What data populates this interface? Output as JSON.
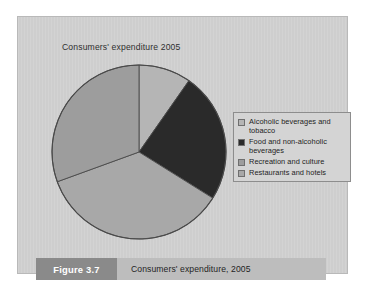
{
  "figure": {
    "number_label": "Figure 3.7",
    "caption": "Consumers' expenditure, 2005"
  },
  "chart_title": "Consumers' expenditure 2005",
  "colors": {
    "panel_background": "#d0d0d0",
    "panel_border": "#b9b9b9",
    "page_background": "#ffffff",
    "pie_outline": "#4a4a4a",
    "legend_background": "#d4d4d4",
    "legend_border": "#8d8d8d",
    "figure_number_bar": "#8a8a8a",
    "caption_bar": "#bdbdbd",
    "figure_number_text": "#ffffff"
  },
  "legend": {
    "position": "right",
    "items": [
      {
        "label": "Alcoholic beverages and tobacco",
        "color": "#b5b5b5",
        "swatch_name": "legend-swatch-alcoholic-beverages-and-tobacco"
      },
      {
        "label": "Food and non-alcoholic beverages",
        "color": "#2a2a2a",
        "swatch_name": "legend-swatch-food-and-non-alcoholic-beverages"
      },
      {
        "label": "Recreation and culture",
        "color": "#9d9d9d",
        "swatch_name": "legend-swatch-recreation-and-culture"
      },
      {
        "label": "Restaurants and hotels",
        "color": "#a8a8a8",
        "swatch_name": "legend-swatch-restaurants-and-hotels"
      }
    ]
  },
  "chart_data": {
    "type": "pie",
    "title": "Consumers' expenditure 2005",
    "xlabel": "",
    "ylabel": "",
    "legend_position": "right",
    "grid": false,
    "start_angle_deg": 0,
    "direction": "clockwise",
    "categories": [
      "Alcoholic beverages and tobacco",
      "Food and non-alcoholic beverages",
      "Recreation and culture",
      "Restaurants and hotels"
    ],
    "values": [
      10,
      24,
      36,
      30
    ],
    "units": "percent",
    "slices": [
      {
        "label": "Alcoholic beverages and tobacco",
        "value": 10,
        "angle_deg": 35,
        "start_deg": 0,
        "end_deg": 35,
        "color": "#b5b5b5"
      },
      {
        "label": "Food and non-alcoholic beverages",
        "value": 24,
        "angle_deg": 87,
        "start_deg": 35,
        "end_deg": 122,
        "color": "#2a2a2a"
      },
      {
        "label": "Recreation and culture",
        "value": 36,
        "angle_deg": 128,
        "start_deg": 122,
        "end_deg": 250,
        "color": "#a8a8a8"
      },
      {
        "label": "Restaurants and hotels",
        "value": 30,
        "angle_deg": 110,
        "start_deg": 250,
        "end_deg": 360,
        "color": "#9d9d9d"
      }
    ]
  }
}
